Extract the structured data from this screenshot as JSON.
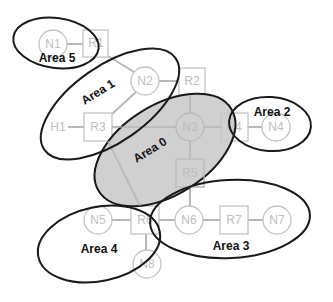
{
  "diagram": {
    "type": "network-area-topology",
    "nodes": [
      {
        "id": "N1",
        "label": "N1",
        "shape": "circle",
        "x": 53,
        "y": 44
      },
      {
        "id": "R1",
        "label": "R1",
        "shape": "square",
        "x": 96,
        "y": 43
      },
      {
        "id": "N2",
        "label": "N2",
        "shape": "circle",
        "x": 145,
        "y": 81
      },
      {
        "id": "R2",
        "label": "R2",
        "shape": "square",
        "x": 192,
        "y": 81
      },
      {
        "id": "H1",
        "label": "H1",
        "shape": "text",
        "x": 58,
        "y": 127
      },
      {
        "id": "R3",
        "label": "R3",
        "shape": "square",
        "x": 98,
        "y": 127
      },
      {
        "id": "N3",
        "label": "N3",
        "shape": "circle",
        "x": 190,
        "y": 127
      },
      {
        "id": "R4",
        "label": "R4",
        "shape": "square",
        "x": 234,
        "y": 127
      },
      {
        "id": "N4",
        "label": "N4",
        "shape": "circle",
        "x": 276,
        "y": 127
      },
      {
        "id": "R5",
        "label": "R5",
        "shape": "square",
        "x": 190,
        "y": 173
      },
      {
        "id": "N5",
        "label": "N5",
        "shape": "circle",
        "x": 98,
        "y": 220
      },
      {
        "id": "R6",
        "label": "R6",
        "shape": "square",
        "x": 145,
        "y": 220
      },
      {
        "id": "N6",
        "label": "N6",
        "shape": "circle",
        "x": 189,
        "y": 220
      },
      {
        "id": "R7",
        "label": "R7",
        "shape": "square",
        "x": 234,
        "y": 220
      },
      {
        "id": "N7",
        "label": "N7",
        "shape": "circle",
        "x": 277,
        "y": 220
      },
      {
        "id": "N8",
        "label": "N8",
        "shape": "circle",
        "x": 147,
        "y": 264
      }
    ],
    "links": [
      [
        "N1",
        "R1"
      ],
      [
        "R1",
        "N2"
      ],
      [
        "N2",
        "R2"
      ],
      [
        "N2",
        "R3"
      ],
      [
        "H1",
        "R3"
      ],
      [
        "R3",
        "N3"
      ],
      [
        "R2",
        "N3"
      ],
      [
        "N3",
        "R4"
      ],
      [
        "R4",
        "N4"
      ],
      [
        "N3",
        "R5"
      ],
      [
        "R3",
        "R6"
      ],
      [
        "R5",
        "N6"
      ],
      [
        "N5",
        "R6"
      ],
      [
        "R6",
        "N6"
      ],
      [
        "N6",
        "R7"
      ],
      [
        "R7",
        "N7"
      ],
      [
        "R6",
        "N8"
      ]
    ],
    "areas": [
      {
        "id": "area0",
        "label": "Area 0",
        "shaded": true
      },
      {
        "id": "area1",
        "label": "Area 1",
        "shaded": false
      },
      {
        "id": "area2",
        "label": "Area 2",
        "shaded": false
      },
      {
        "id": "area3",
        "label": "Area 3",
        "shaded": false
      },
      {
        "id": "area4",
        "label": "Area 4",
        "shaded": false
      },
      {
        "id": "area5",
        "label": "Area 5",
        "shaded": false
      }
    ],
    "colors": {
      "area_stroke": "#1a1a1a",
      "area0_fill": "#c8c8c8",
      "node_stroke": "#c4c4c4",
      "node_label": "#c0c0c0",
      "link": "#b8b8b8"
    }
  }
}
